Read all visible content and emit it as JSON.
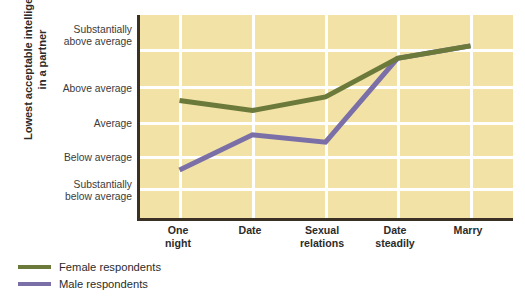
{
  "chart_data": {
    "type": "line",
    "title": "",
    "xlabel": "",
    "ylabel": "Lowest acceptable intelligence in a partner",
    "categories": [
      "One night",
      "Date",
      "Sexual relations",
      "Date steadily",
      "Marry"
    ],
    "category_lines": [
      [
        "One",
        "night"
      ],
      [
        "Date",
        ""
      ],
      [
        "Sexual",
        "relations"
      ],
      [
        "Date",
        "steadily"
      ],
      [
        "Marry",
        ""
      ]
    ],
    "ytick_labels": [
      "Substantially above average",
      "Above average",
      "Average",
      "Below average",
      "Substantially below average"
    ],
    "ytick_lines": [
      [
        "Substantially",
        "above average"
      ],
      [
        "Above average",
        ""
      ],
      [
        "Average",
        ""
      ],
      [
        "Below average",
        ""
      ],
      [
        "Substantially",
        "below average"
      ]
    ],
    "ylim": [
      -2,
      2
    ],
    "ytick_values": [
      2,
      1,
      0,
      -1,
      -2
    ],
    "grid": true,
    "legend_position": "below-left",
    "series": [
      {
        "name": "Female respondents",
        "color": "#6b7a3a",
        "values": [
          0.52,
          0.23,
          0.62,
          1.73,
          2.09
        ]
      },
      {
        "name": "Male respondents",
        "color": "#7b6fa8",
        "values": [
          -1.48,
          -0.47,
          -0.68,
          1.73,
          2.09
        ]
      }
    ],
    "colors": {
      "plot_background": "#f2e2a6",
      "gridline": "#ffffff",
      "axis": "#3a3124",
      "female": "#6b7a3a",
      "male": "#7b6fa8",
      "text": "#2b2b2b"
    }
  },
  "axis_title": {
    "line1": "Lowest acceptable intelligence",
    "line2": "in a partner"
  },
  "legend": {
    "items": [
      {
        "label": "Female respondents",
        "color": "#6b7a3a"
      },
      {
        "label": "Male respondents",
        "color": "#7b6fa8"
      }
    ]
  }
}
